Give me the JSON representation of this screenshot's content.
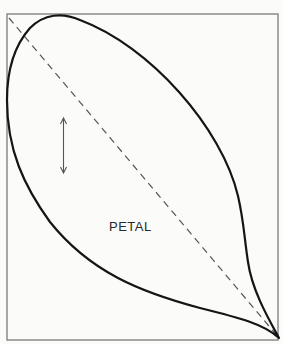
{
  "diagram": {
    "petal_label": "PETAL",
    "colors": {
      "background": "#fbfbfa",
      "frame": "#7a7a7a",
      "outline": "#151515",
      "dashed_line": "#555555",
      "arrow": "#555555",
      "text": "#2a2a2a"
    },
    "elements": [
      {
        "type": "frame",
        "description": "rectangular border"
      },
      {
        "type": "petal-outline",
        "description": "teardrop petal shape, rounded at top-left, pointed tip at bottom-right"
      },
      {
        "type": "dashed-diagonal",
        "description": "dashed line from top-left corner to bottom-right tip"
      },
      {
        "type": "double-arrow",
        "description": "vertical double-headed arrow indicating grain direction"
      }
    ]
  }
}
